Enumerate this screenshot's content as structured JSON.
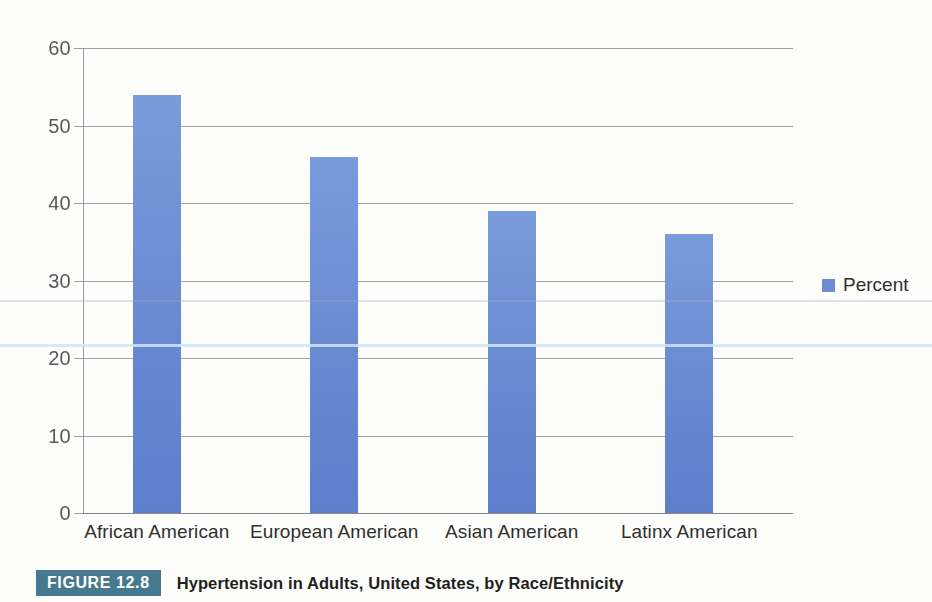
{
  "chart_data": {
    "type": "bar",
    "title": "Hypertension in Adults, United States, by Race/Ethnicity",
    "categories": [
      "African American",
      "European American",
      "Asian American",
      "Latinx American"
    ],
    "values": [
      54,
      46,
      39,
      36
    ],
    "series": [
      {
        "name": "Percent",
        "values": [
          54,
          46,
          39,
          36
        ]
      }
    ],
    "xlabel": "",
    "ylabel": "",
    "ylim": [
      0,
      60
    ],
    "yticks": [
      0,
      10,
      20,
      30,
      40,
      50,
      60
    ],
    "ytick_labels": [
      "0",
      "10",
      "20",
      "30",
      "40",
      "50",
      "60"
    ],
    "grid": true,
    "legend": {
      "position": "right",
      "entries": [
        "Percent"
      ]
    },
    "bar_color": "#6b8cd2"
  },
  "legend": {
    "label": "Percent",
    "swatch_color": "#6b8cd2"
  },
  "caption": {
    "figure_number": "FIGURE 12.8",
    "title": "Hypertension in Adults, United States, by Race/Ethnicity",
    "badge_color": "#46798f"
  }
}
